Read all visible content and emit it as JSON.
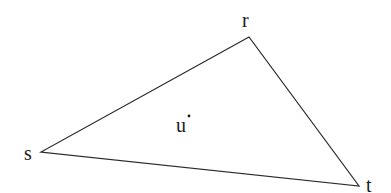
{
  "diagram": {
    "type": "triangle",
    "stroke_color": "#2a2a2a",
    "vertices": [
      {
        "id": "r",
        "label": "r",
        "x": 249,
        "y": 37
      },
      {
        "id": "s",
        "label": "s",
        "x": 41,
        "y": 152
      },
      {
        "id": "t",
        "label": "t",
        "x": 359,
        "y": 186
      }
    ],
    "interior_point": {
      "id": "u",
      "label": "u",
      "x": 189,
      "y": 116
    }
  }
}
